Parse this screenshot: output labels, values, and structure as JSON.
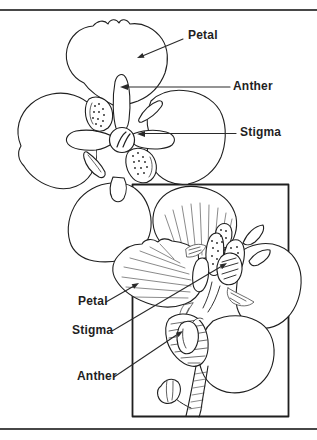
{
  "labels": {
    "top_petal": "Petal",
    "top_anther": "Anther",
    "top_stigma": "Stigma",
    "bottom_petal": "Petal",
    "bottom_stigma": "Stigma",
    "bottom_anther": "Anther"
  },
  "colors": {
    "ink": "#1f1f1f",
    "rule": "#474747",
    "background": "#ffffff"
  }
}
